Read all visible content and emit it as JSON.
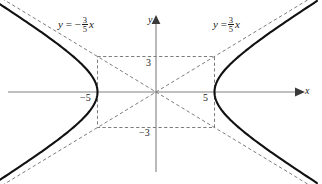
{
  "figure": {
    "background_color": "#ffffff",
    "curve_color": "#111111",
    "axis_color": "#777777",
    "dash_color": "#555555"
  },
  "labels": {
    "asymptote_left": {
      "lhs": "y",
      "equals": "=",
      "sign": "−",
      "numerator": "3",
      "denominator": "5",
      "variable": "x",
      "full_text": "y = -3/5 x"
    },
    "asymptote_right": {
      "lhs": "y",
      "equals": "=",
      "sign": "",
      "numerator": "3",
      "denominator": "5",
      "variable": "x",
      "full_text": "y = 3/5 x"
    },
    "x_axis": "x",
    "y_axis": "y",
    "tick_y_positive": "3",
    "tick_y_negative": "−3",
    "tick_x_positive": "5",
    "tick_x_negative": "−5"
  },
  "chart_data": {
    "type": "line",
    "title": "",
    "xlabel": "x",
    "ylabel": "y",
    "xlim": [
      -13.7,
      14.2
    ],
    "ylim": [
      -7.8,
      7.8
    ],
    "grid": false,
    "legend": "none",
    "equation": "x^2/25 - y^2/9 = 1",
    "semi_axis_a": 5,
    "semi_axis_b": 3,
    "vertices": [
      [
        -5,
        0
      ],
      [
        5,
        0
      ]
    ],
    "annotations": [
      {
        "text": "y = -3/5 x",
        "x": -8.2,
        "y": 6.5
      },
      {
        "text": "y = 3/5 x",
        "x": 5.5,
        "y": 6.5
      },
      {
        "text": "3",
        "x": -0.9,
        "y": 2.6
      },
      {
        "text": "-3",
        "x": -1.45,
        "y": -3.45
      },
      {
        "text": "5",
        "x": 4.05,
        "y": -0.55
      },
      {
        "text": "-5",
        "x": -6.5,
        "y": -0.55
      }
    ],
    "series": [
      {
        "name": "hyperbola-right-branch",
        "style": "solid",
        "x": [
          5,
          5.05,
          5.2,
          5.5,
          6,
          6.8,
          7.8,
          9,
          10.5,
          12,
          13.6
        ],
        "y": [
          0,
          0.54,
          1.08,
          1.52,
          2.05,
          2.76,
          3.44,
          4.2,
          5.1,
          6.0,
          6.97
        ]
      },
      {
        "name": "hyperbola-left-branch",
        "style": "solid",
        "x": [
          -5,
          -5.05,
          -5.2,
          -5.5,
          -6,
          -6.8,
          -7.8,
          -9,
          -10.5,
          -12,
          -13.6
        ],
        "y": [
          0,
          0.54,
          1.08,
          1.52,
          2.05,
          2.76,
          3.44,
          4.2,
          5.1,
          6.0,
          6.97
        ]
      },
      {
        "name": "asymptote-positive-slope",
        "style": "dashed",
        "slope": 0.6,
        "x": [
          -13.7,
          13.7
        ],
        "y": [
          -8.22,
          8.22
        ]
      },
      {
        "name": "asymptote-negative-slope",
        "style": "dashed",
        "slope": -0.6,
        "x": [
          -13.7,
          13.7
        ],
        "y": [
          8.22,
          -8.22
        ]
      }
    ],
    "reference_rectangle": {
      "style": "dashed",
      "corners": [
        [
          -5,
          3
        ],
        [
          5,
          3
        ],
        [
          5,
          -3
        ],
        [
          -5,
          -3
        ]
      ]
    }
  }
}
